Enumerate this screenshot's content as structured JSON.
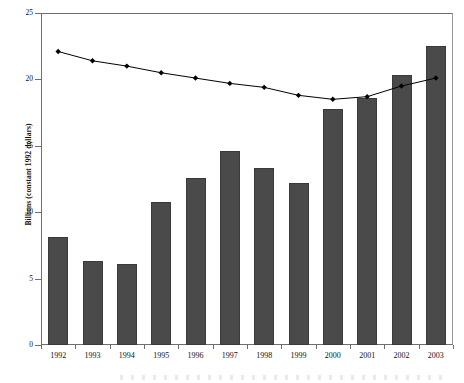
{
  "chart_data": {
    "type": "bar",
    "title": "",
    "subtitle": "",
    "xlabel": "",
    "ylabel": "Billions (constant 1992 dollars)",
    "categories": [
      "1992",
      "1993",
      "1994",
      "1995",
      "1996",
      "1997",
      "1998",
      "1999",
      "2000",
      "2001",
      "2002",
      "2003"
    ],
    "ylim": [
      0,
      25
    ],
    "yticks": [
      0,
      5,
      10,
      15,
      20,
      25
    ],
    "ytick_labels": [
      "0",
      "5",
      "10",
      "15",
      "20",
      "25"
    ],
    "grid": false,
    "legend": "none",
    "series": [
      {
        "name": "Bars",
        "type": "bar",
        "color": "#4a4a4a",
        "values": [
          8.1,
          6.3,
          6.1,
          10.8,
          12.6,
          14.6,
          13.3,
          12.2,
          17.8,
          18.6,
          20.3,
          22.5
        ]
      },
      {
        "name": "Line",
        "type": "line",
        "color": "#000000",
        "marker": "diamond",
        "values": [
          22.1,
          21.4,
          21.0,
          20.5,
          20.1,
          19.7,
          19.4,
          18.8,
          18.5,
          18.7,
          19.5,
          20.1
        ]
      }
    ]
  },
  "axis": {
    "y_title": "Billions (constant 1992 dollars)"
  }
}
